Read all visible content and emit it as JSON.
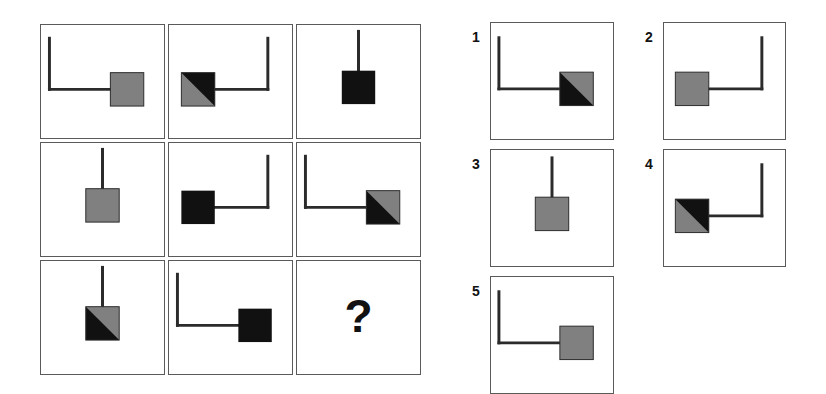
{
  "puzzle": {
    "kind": "raven-progressive-matrix",
    "title": "",
    "question_mark": "?",
    "colors": {
      "stroke": "#2b2b2b",
      "panel_border": "#5a5a5a",
      "black_fill": "#111111",
      "gray_fill": "#808080",
      "background": "#ffffff"
    },
    "geometry": {
      "matrix": {
        "x": 40,
        "y": 24,
        "cell_w": 125,
        "cell_h": 115,
        "gap_x": 3,
        "gap_y": 3
      },
      "options_left": {
        "x": 490,
        "y": 22,
        "w": 124,
        "h": 118,
        "gap_y": 9
      },
      "options_right": {
        "x": 663,
        "y": 22,
        "w": 123,
        "h": 118,
        "gap_y": 9
      },
      "square_size": 34,
      "arm_length": 62,
      "stroke_width": 3
    }
  },
  "matrix": {
    "name": "matrix-3x3",
    "rows": [
      {
        "name": "matrix-row-1",
        "cells": [
          {
            "name": "matrix-cell-1-1",
            "square": "gray",
            "square_side": "right",
            "connector": "L",
            "label": ""
          },
          {
            "name": "matrix-cell-1-2",
            "square": "half-black-upper-right",
            "square_side": "left",
            "connector": "reverse-L",
            "label": ""
          },
          {
            "name": "matrix-cell-1-3",
            "square": "black",
            "square_side": "center",
            "connector": "stem",
            "label": ""
          }
        ]
      },
      {
        "name": "matrix-row-2",
        "cells": [
          {
            "name": "matrix-cell-2-1",
            "square": "gray",
            "square_side": "center",
            "connector": "stem",
            "label": ""
          },
          {
            "name": "matrix-cell-2-2",
            "square": "black",
            "square_side": "left",
            "connector": "reverse-L",
            "label": ""
          },
          {
            "name": "matrix-cell-2-3",
            "square": "half-black-lower-left",
            "square_side": "right",
            "connector": "L",
            "label": ""
          }
        ]
      },
      {
        "name": "matrix-row-3",
        "cells": [
          {
            "name": "matrix-cell-3-1",
            "square": "half-black-lower-left",
            "square_side": "center",
            "connector": "stem",
            "label": ""
          },
          {
            "name": "matrix-cell-3-2",
            "square": "black",
            "square_side": "right",
            "connector": "L",
            "label": ""
          },
          {
            "name": "matrix-cell-3-3",
            "square": "none",
            "square_side": "none",
            "connector": "none",
            "label": "?"
          }
        ]
      }
    ]
  },
  "options": [
    {
      "name": "option-1",
      "number": "1",
      "square": "half-black-lower-left",
      "square_side": "right",
      "connector": "L"
    },
    {
      "name": "option-2",
      "number": "2",
      "square": "gray",
      "square_side": "left",
      "connector": "reverse-L"
    },
    {
      "name": "option-3",
      "number": "3",
      "square": "gray",
      "square_side": "center",
      "connector": "stem"
    },
    {
      "name": "option-4",
      "number": "4",
      "square": "half-black-upper-right",
      "square_side": "left",
      "connector": "reverse-L"
    },
    {
      "name": "option-5",
      "number": "5",
      "square": "gray",
      "square_side": "right",
      "connector": "L"
    }
  ]
}
